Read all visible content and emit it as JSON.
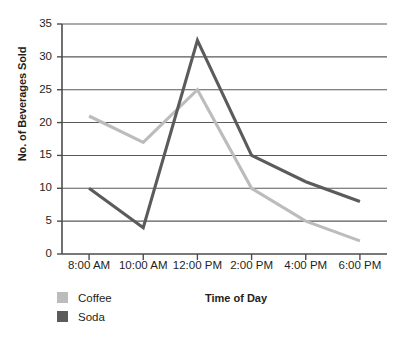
{
  "chart_data": {
    "type": "line",
    "title": "",
    "xlabel": "Time of Day",
    "ylabel": "No. of Beverages Sold",
    "categories": [
      "8:00 AM",
      "10:00 AM",
      "12:00 PM",
      "2:00 PM",
      "4:00 PM",
      "6:00 PM"
    ],
    "series": [
      {
        "name": "Coffee",
        "color": "#bcbcbc",
        "values": [
          21,
          17,
          25,
          10,
          5,
          2
        ]
      },
      {
        "name": "Soda",
        "color": "#5b5b5b",
        "values": [
          10,
          4,
          32.5,
          15,
          11,
          8
        ]
      }
    ],
    "ylim": [
      0,
      35
    ],
    "ytick_step": 5,
    "yticks": [
      35,
      30,
      25,
      20,
      15,
      10,
      5,
      0
    ],
    "ytick_labels": [
      "35",
      "30",
      "25",
      "20",
      "15",
      "10",
      "5",
      "0"
    ],
    "grid": "horizontal",
    "legend_position": "bottom-left",
    "axis_color": "#4d4d4d",
    "grid_color": "#595959"
  },
  "legend": {
    "items": [
      {
        "label": "Coffee"
      },
      {
        "label": "Soda"
      }
    ]
  }
}
